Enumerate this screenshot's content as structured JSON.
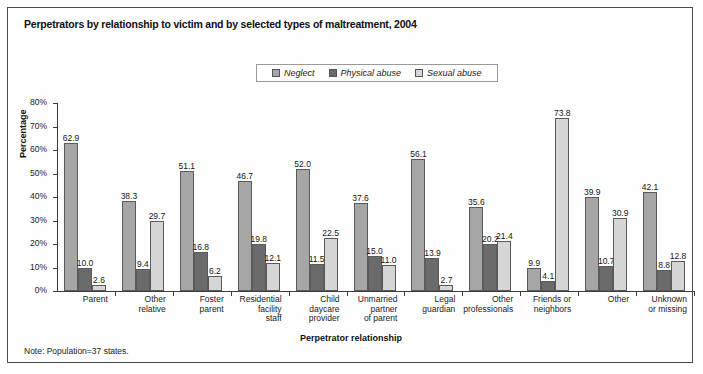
{
  "figure": {
    "title": "Perpetrators by relationship to victim and by selected types of maltreatment, 2004",
    "note": "Note: Population=37 states."
  },
  "colors": {
    "neglect": "#a6a6a6",
    "physical_abuse": "#6b6b6b",
    "sexual_abuse": "#d6d6d6",
    "axis": "#3c3c3c",
    "frame": "#4a4a4a"
  },
  "chart_data": {
    "type": "bar",
    "title": "Perpetrators by relationship to victim and by selected types of maltreatment, 2004",
    "xlabel": "Perpetrator relationship",
    "ylabel": "Percentage",
    "ylim": [
      0,
      80
    ],
    "ytick_labels": [
      "0%",
      "10%",
      "20%",
      "30%",
      "40%",
      "50%",
      "60%",
      "70%",
      "80%"
    ],
    "ytick_values": [
      0,
      10,
      20,
      30,
      40,
      50,
      60,
      70,
      80
    ],
    "grid": false,
    "legend_position": "top-center",
    "categories": [
      "Parent",
      "Other\nrelative",
      "Foster\nparent",
      "Residential\nfacility\nstaff",
      "Child\ndaycare\nprovider",
      "Unmarried\npartner\nof parent",
      "Legal\nguardian",
      "Other\nprofessionals",
      "Friends or\nneighbors",
      "Other",
      "Unknown\nor missing"
    ],
    "series": [
      {
        "name": "Neglect",
        "values": [
          62.9,
          38.3,
          51.1,
          46.7,
          52.0,
          37.6,
          56.1,
          35.6,
          9.9,
          39.9,
          42.1
        ],
        "labels": [
          "62.9",
          "38.3",
          "51.1",
          "46.7",
          "52.0",
          "37.6",
          "56.1",
          "35.6",
          "9.9",
          "39.9",
          "42.1"
        ]
      },
      {
        "name": "Physical abuse",
        "values": [
          10.0,
          9.4,
          16.8,
          19.8,
          11.5,
          15.0,
          13.9,
          20.2,
          4.1,
          10.7,
          8.8
        ],
        "labels": [
          "10.0",
          "9.4",
          "16.8",
          "19.8",
          "11.5",
          "15.0",
          "13.9",
          "20.2",
          "4.1",
          "10.7",
          "8.8"
        ]
      },
      {
        "name": "Sexual abuse",
        "values": [
          2.6,
          29.7,
          6.2,
          12.1,
          22.5,
          11.0,
          2.7,
          21.4,
          73.8,
          30.9,
          12.8
        ],
        "labels": [
          "2.6",
          "29.7",
          "6.2",
          "12.1",
          "22.5",
          "11.0",
          "2.7",
          "21.4",
          "73.8",
          "30.9",
          "12.8"
        ]
      }
    ]
  }
}
